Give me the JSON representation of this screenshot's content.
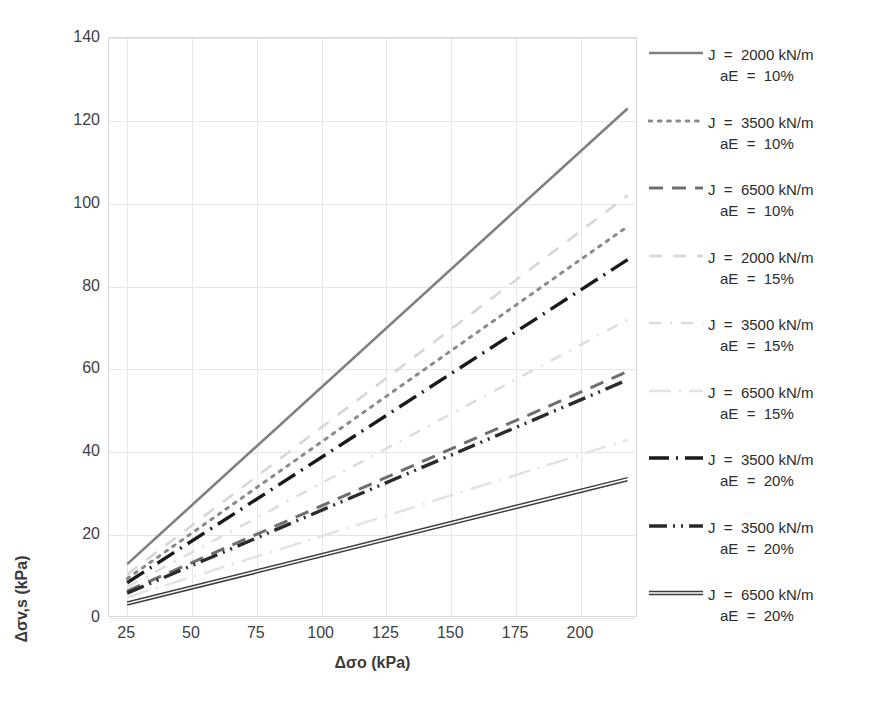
{
  "chart_data": {
    "type": "line",
    "title": "",
    "xlabel": "Δσo (kPa)",
    "ylabel": "Δσv,s (kPa)",
    "xlim": [
      18,
      222
    ],
    "ylim": [
      0,
      140
    ],
    "xticks": [
      25,
      50,
      75,
      100,
      125,
      150,
      175,
      200
    ],
    "yticks": [
      0,
      20,
      40,
      60,
      80,
      100,
      120,
      140
    ],
    "grid": true,
    "legend_position": "right",
    "x": [
      25,
      218
    ],
    "series": [
      {
        "name": "J = 2000 kN/m\naE = 10%",
        "j": "2000",
        "ae": "10%",
        "label_line1": "J  =  2000 kN/m",
        "label_line2": "aE  =  10%",
        "values": [
          13.0,
          123.0
        ],
        "color": "#808080",
        "style": "solid",
        "width": 2.6
      },
      {
        "name": "J = 3500 kN/m\naE = 10%",
        "j": "3500",
        "ae": "10%",
        "label_line1": "J  =  3500 kN/m",
        "label_line2": "aE  =  10%",
        "values": [
          9.5,
          94.5
        ],
        "color": "#8a8a8a",
        "style": "dotted",
        "width": 3.0
      },
      {
        "name": "J = 6500 kN/m\naE = 10%",
        "j": "6500",
        "ae": "10%",
        "label_line1": "J  =  6500 kN/m",
        "label_line2": "aE  =  10%",
        "values": [
          6.5,
          59.5
        ],
        "color": "#6e6e6e",
        "style": "dashed",
        "width": 3.0
      },
      {
        "name": "J = 2000 kN/m\naE = 15%",
        "j": "2000",
        "ae": "15%",
        "label_line1": "J  =  2000 kN/m",
        "label_line2": "aE  =  15%",
        "values": [
          10.5,
          102.0
        ],
        "color": "#d6d6d6",
        "style": "dashed-light",
        "width": 2.6
      },
      {
        "name": "J = 3500 kN/m\naE = 15%",
        "j": "3500",
        "ae": "15%",
        "label_line1": "J  =  3500 kN/m",
        "label_line2": "aE  =  15%",
        "values": [
          7.5,
          72.0
        ],
        "color": "#dcdcdc",
        "style": "dashdot-light",
        "width": 2.4
      },
      {
        "name": "J = 6500 kN/m\naE = 15%",
        "j": "6500",
        "ae": "15%",
        "label_line1": "J  =  6500 kN/m",
        "label_line2": "aE  =  15%",
        "values": [
          5.0,
          43.0
        ],
        "color": "#e2e2e2",
        "style": "longdashdot-light",
        "width": 2.4
      },
      {
        "name": "J = 3500 kN/m\naE = 20% (A)",
        "j": "3500",
        "ae": "20%",
        "label_line1": "J  =  3500 kN/m",
        "label_line2": "aE  =  20%",
        "values": [
          8.5,
          86.5
        ],
        "color": "#1a1a1a",
        "style": "dashdot",
        "width": 3.4
      },
      {
        "name": "J = 3500 kN/m\naE = 20% (B)",
        "j": "3500",
        "ae": "20%",
        "label_line1": "J  =  3500 kN/m",
        "label_line2": "aE  =  20%",
        "values": [
          6.0,
          57.5
        ],
        "color": "#2b2b2b",
        "style": "dashdotdot",
        "width": 3.4
      },
      {
        "name": "J = 6500 kN/m\naE = 20%",
        "j": "6500",
        "ae": "20%",
        "label_line1": "J  =  6500 kN/m",
        "label_line2": "aE  =  20%",
        "values": [
          3.5,
          33.5
        ],
        "color": "#3d3d3d",
        "style": "solid-double",
        "width": 3.0
      }
    ]
  },
  "axis": {
    "x_title": "Δσo (kPa)",
    "y_title": "Δσv,s (kPa)"
  }
}
